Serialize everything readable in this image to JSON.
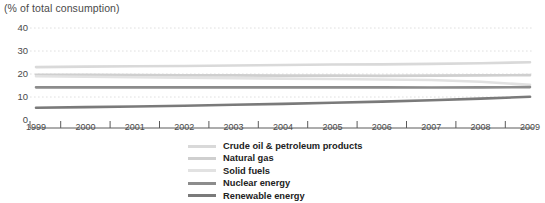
{
  "chart_data": {
    "type": "line",
    "title": "(% of total consumption)",
    "xlabel": "",
    "ylabel": "(% of total consumption)",
    "ylim": [
      0,
      40
    ],
    "yticks": [
      0,
      10,
      20,
      30,
      40
    ],
    "grid": true,
    "legend_position": "bottom",
    "categories": [
      "1999",
      "2000",
      "2001",
      "2002",
      "2003",
      "2004",
      "2005",
      "2006",
      "2007",
      "2008",
      "2009"
    ],
    "series": [
      {
        "name": "Crude oil & petroleum products",
        "color": "#d9d9d9",
        "values": [
          23.0,
          23.2,
          23.4,
          23.5,
          23.7,
          23.9,
          24.1,
          24.2,
          24.4,
          24.7,
          25.1
        ]
      },
      {
        "name": "Natural gas",
        "color": "#cfcfcf",
        "values": [
          19.7,
          19.6,
          19.5,
          19.4,
          19.4,
          19.3,
          19.3,
          19.2,
          19.3,
          19.4,
          19.5
        ]
      },
      {
        "name": "Solid fuels",
        "color": "#e2e2e2",
        "values": [
          19.0,
          18.8,
          18.6,
          18.4,
          18.2,
          18.0,
          17.8,
          17.6,
          17.4,
          16.6,
          15.3
        ]
      },
      {
        "name": "Nuclear energy",
        "color": "#8c8c8c",
        "values": [
          14.2,
          14.2,
          14.2,
          14.2,
          14.2,
          14.2,
          14.2,
          14.2,
          14.1,
          14.2,
          14.3
        ]
      },
      {
        "name": "Renewable energy",
        "color": "#7a7a7a",
        "values": [
          5.3,
          5.6,
          5.9,
          6.2,
          6.6,
          7.0,
          7.5,
          8.0,
          8.6,
          9.3,
          10.1
        ]
      }
    ]
  },
  "legend": {
    "items": [
      {
        "label": "Crude oil & petroleum products",
        "color": "#d9d9d9"
      },
      {
        "label": "Natural gas",
        "color": "#cfcfcf"
      },
      {
        "label": "Solid fuels",
        "color": "#e2e2e2"
      },
      {
        "label": "Nuclear energy",
        "color": "#8c8c8c"
      },
      {
        "label": "Renewable energy",
        "color": "#7a7a7a"
      }
    ]
  }
}
